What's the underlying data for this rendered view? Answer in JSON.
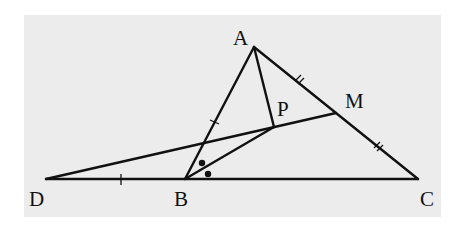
{
  "figure": {
    "type": "geometry-diagram",
    "background": "#ececec",
    "line_color": "#111111"
  },
  "points": {
    "A": {
      "label": "A",
      "x": 254,
      "y": 47
    },
    "B": {
      "label": "B",
      "x": 185,
      "y": 179
    },
    "C": {
      "label": "C",
      "x": 418,
      "y": 179
    },
    "D": {
      "label": "D",
      "x": 46,
      "y": 179
    },
    "M": {
      "label": "M",
      "x": 336,
      "y": 113
    },
    "P": {
      "label": "P",
      "x": 274,
      "y": 127
    }
  },
  "segments": [
    "AB",
    "AC",
    "DC",
    "AP",
    "DM",
    "BP"
  ],
  "marks": {
    "single_tick": [
      "AB",
      "DB"
    ],
    "double_tick": [
      "AM",
      "MC"
    ],
    "equal_angle_dots": "angle ABP = angle PBC"
  }
}
